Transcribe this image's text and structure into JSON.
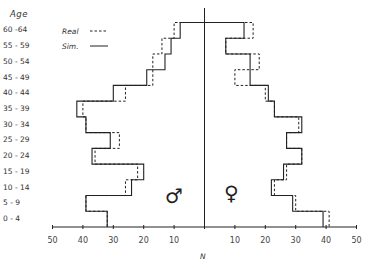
{
  "chart_data": {
    "type": "bar",
    "subtype": "population-pyramid-step",
    "title": "",
    "ylabel": "Age",
    "xlabel": "N",
    "categories": [
      "0 - 4",
      "5 - 9",
      "10 - 14",
      "15 - 19",
      "20 - 24",
      "25 - 29",
      "30 - 34",
      "35 - 39",
      "40 - 44",
      "45 - 49",
      "50 - 54",
      "55 - 59",
      "60 -64"
    ],
    "xlim": [
      -50,
      50
    ],
    "x_ticks": [
      50,
      40,
      30,
      20,
      10,
      10,
      20,
      30,
      40,
      50
    ],
    "legend": [
      {
        "name": "Real",
        "style": "dashed"
      },
      {
        "name": "Sim.",
        "style": "solid"
      }
    ],
    "sides": {
      "left": "male",
      "right": "female"
    },
    "series": [
      {
        "name": "Real",
        "sex": "male",
        "values": [
          32,
          39,
          26,
          22,
          36,
          28,
          39,
          40,
          26,
          17,
          17,
          14,
          10
        ]
      },
      {
        "name": "Sim.",
        "sex": "male",
        "values": [
          32,
          39,
          24,
          20,
          37,
          31,
          39,
          42,
          30,
          19,
          13,
          11,
          8
        ]
      },
      {
        "name": "Real",
        "sex": "female",
        "values": [
          41,
          30,
          23,
          27,
          32,
          27,
          31,
          23,
          20,
          10,
          18,
          7,
          16
        ]
      },
      {
        "name": "Sim.",
        "sex": "female",
        "values": [
          39,
          29,
          22,
          26,
          32,
          27,
          32,
          23,
          21,
          15,
          15,
          7,
          13
        ]
      }
    ],
    "annotations": [
      "♂",
      "♀"
    ],
    "grid": false
  },
  "labels": {
    "age_title": "Age",
    "legend_real": "Real",
    "legend_sim": "Sim.",
    "x_axis": "N",
    "male_symbol": "♂",
    "female_symbol": "♀"
  }
}
